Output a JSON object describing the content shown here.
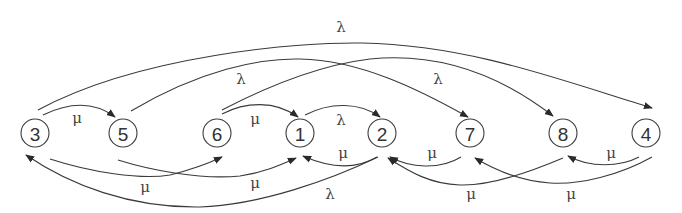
{
  "diagram": {
    "type": "state-transition-graph",
    "nodes": [
      {
        "id": "3",
        "label": "3",
        "x": 35,
        "y": 133
      },
      {
        "id": "5",
        "label": "5",
        "x": 123,
        "y": 133
      },
      {
        "id": "6",
        "label": "6",
        "x": 217,
        "y": 133
      },
      {
        "id": "1",
        "label": "1",
        "x": 300,
        "y": 133
      },
      {
        "id": "2",
        "label": "2",
        "x": 382,
        "y": 133
      },
      {
        "id": "7",
        "label": "7",
        "x": 470,
        "y": 133
      },
      {
        "id": "8",
        "label": "8",
        "x": 563,
        "y": 133
      },
      {
        "id": "4",
        "label": "4",
        "x": 646,
        "y": 133
      }
    ],
    "edges": [
      {
        "from": "3",
        "to": "4",
        "label": "λ",
        "lx": 341,
        "ly": 27
      },
      {
        "from": "5",
        "to": "7",
        "label": "λ",
        "lx": 241,
        "ly": 79
      },
      {
        "from": "6",
        "to": "8",
        "label": "λ",
        "lx": 438,
        "ly": 79
      },
      {
        "from": "3",
        "to": "5",
        "label": "μ",
        "lx": 77,
        "ly": 118
      },
      {
        "from": "6",
        "to": "1",
        "label": "μ",
        "lx": 255,
        "ly": 119
      },
      {
        "from": "1",
        "to": "2",
        "label": "λ",
        "lx": 341,
        "ly": 120
      },
      {
        "from": "2",
        "to": "1",
        "label": "μ",
        "lx": 343,
        "ly": 153
      },
      {
        "from": "3",
        "to": "6",
        "label": "μ",
        "lx": 145,
        "ly": 187
      },
      {
        "from": "5",
        "to": "1",
        "label": "μ",
        "lx": 255,
        "ly": 183
      },
      {
        "from": "2",
        "to": "3",
        "label": "λ",
        "lx": 330,
        "ly": 194
      },
      {
        "from": "7",
        "to": "2",
        "label": "μ",
        "lx": 432,
        "ly": 153
      },
      {
        "from": "8",
        "to": "2",
        "label": "μ",
        "lx": 471,
        "ly": 194
      },
      {
        "from": "4",
        "to": "8",
        "label": "μ",
        "lx": 611,
        "ly": 153
      },
      {
        "from": "4",
        "to": "7",
        "label": "μ",
        "lx": 571,
        "ly": 194
      }
    ]
  }
}
